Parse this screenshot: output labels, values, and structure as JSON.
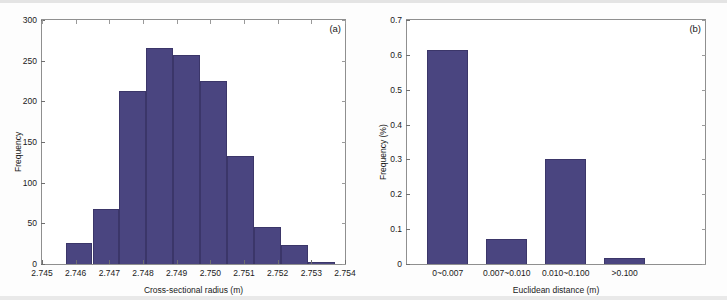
{
  "figure": {
    "background_color": "#fdfdfd",
    "bar_color": "#4a4580",
    "axis_color": "#8f8f8f"
  },
  "panels": [
    {
      "id": "a",
      "letter": "(a)",
      "xlabel": "Cross-sectional radius (m)",
      "ylabel": "Frequency"
    },
    {
      "id": "b",
      "letter": "(b)",
      "xlabel": "Euclidean distance (m)",
      "ylabel": "Frequency (%)"
    }
  ],
  "chart_data": [
    {
      "type": "bar",
      "id": "panel-a-histogram",
      "title": "",
      "panel_label": "(a)",
      "xlabel": "Cross-sectional radius (m)",
      "ylabel": "Frequency",
      "xlim": [
        2.745,
        2.754
      ],
      "ylim": [
        0,
        300
      ],
      "xticks": [
        "2.745",
        "2.746",
        "2.747",
        "2.748",
        "2.749",
        "2.750",
        "2.751",
        "2.752",
        "2.753",
        "2.754"
      ],
      "xtick_values": [
        2.745,
        2.746,
        2.747,
        2.748,
        2.749,
        2.75,
        2.751,
        2.752,
        2.753,
        2.754
      ],
      "yticks": [
        "0",
        "50",
        "100",
        "150",
        "200",
        "250",
        "300"
      ],
      "ytick_values": [
        0,
        50,
        100,
        150,
        200,
        250,
        300
      ],
      "grid": false,
      "legend": "none",
      "bin_edges": [
        2.7457,
        2.7465,
        2.7473,
        2.7481,
        2.7489,
        2.7497,
        2.7505,
        2.7513,
        2.7521,
        2.7529,
        2.7537
      ],
      "bin_centers": [
        2.7461,
        2.7469,
        2.7477,
        2.7485,
        2.7493,
        2.7501,
        2.7509,
        2.7517,
        2.7525,
        2.7533
      ],
      "values": [
        26,
        68,
        213,
        265,
        257,
        225,
        133,
        45,
        23,
        2
      ],
      "bars": [
        {
          "bin": "2.7457-2.7465",
          "frequency": 26
        },
        {
          "bin": "2.7465-2.7473",
          "frequency": 68
        },
        {
          "bin": "2.7473-2.7481",
          "frequency": 213
        },
        {
          "bin": "2.7481-2.7489",
          "frequency": 265
        },
        {
          "bin": "2.7489-2.7497",
          "frequency": 257
        },
        {
          "bin": "2.7497-2.7505",
          "frequency": 225
        },
        {
          "bin": "2.7505-2.7513",
          "frequency": 133
        },
        {
          "bin": "2.7513-2.7521",
          "frequency": 45
        },
        {
          "bin": "2.7521-2.7529",
          "frequency": 23
        },
        {
          "bin": "2.7529-2.7537",
          "frequency": 2
        }
      ]
    },
    {
      "type": "bar",
      "id": "panel-b-bar",
      "title": "",
      "panel_label": "(b)",
      "xlabel": "Euclidean distance (m)",
      "ylabel": "Frequency (%)",
      "ylim": [
        0,
        0.7
      ],
      "yticks": [
        "0",
        "0.1",
        "0.2",
        "0.3",
        "0.4",
        "0.5",
        "0.6",
        "0.7"
      ],
      "ytick_values": [
        0,
        0.1,
        0.2,
        0.3,
        0.4,
        0.5,
        0.6,
        0.7
      ],
      "categories": [
        "0~0.007",
        "0.007~0.010",
        "0.010~0.100",
        ">0.100"
      ],
      "values": [
        0.615,
        0.071,
        0.3,
        0.018
      ],
      "grid": false,
      "legend": "none"
    }
  ]
}
